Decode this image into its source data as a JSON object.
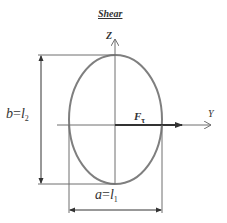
{
  "title": "Shear",
  "axes": {
    "z_label": "Z",
    "y_label": "Y"
  },
  "force": {
    "symbol": "F",
    "subscript": "τ"
  },
  "dimensions": {
    "height": {
      "var": "b",
      "equals": "=",
      "symbol": "l",
      "subscript": "2"
    },
    "width": {
      "var": "a",
      "equals": "=",
      "symbol": "l",
      "subscript": "1"
    }
  },
  "colors": {
    "ellipse": "#7f7f7f",
    "lines": "#6f6f6f",
    "force_arrow": "#333333",
    "text": "#333333"
  }
}
